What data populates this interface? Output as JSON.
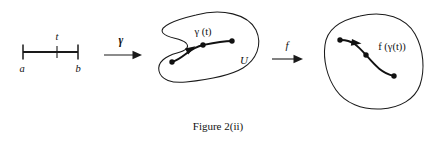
{
  "figure": {
    "caption": "Figure 2(ii)",
    "background_color": "#ffffff",
    "ink_color": "#111111",
    "stroke_color": "#1a1a1a"
  },
  "interval": {
    "name": "closed-interval",
    "left_endpoint_label": "a",
    "right_endpoint_label": "b",
    "parameter_label": "t"
  },
  "map_arrow_1": {
    "label": "γ",
    "icon": "arrow-right-icon"
  },
  "domain_blob": {
    "name": "open-set-U",
    "set_label": "U",
    "curve_label": "γ (t)",
    "curve_icon": "curve-with-arrow-icon",
    "point_count": 3
  },
  "map_arrow_2": {
    "label": "f",
    "icon": "arrow-right-icon"
  },
  "image_blob": {
    "name": "image-set",
    "curve_label": "f (γ(t))",
    "curve_icon": "curve-with-arrow-icon",
    "point_count": 3
  }
}
